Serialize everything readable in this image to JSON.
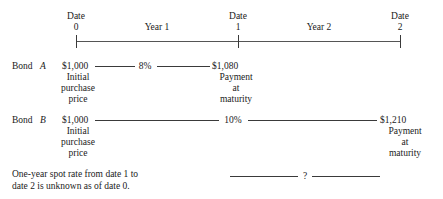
{
  "figure": {
    "type": "timeline-diagram"
  },
  "timeline": {
    "axis": {
      "start_x": 76,
      "end_x": 400,
      "y": 41
    },
    "dates": [
      {
        "label": "Date",
        "value": "0",
        "x": 76
      },
      {
        "label": "Date",
        "value": "1",
        "x": 238
      },
      {
        "label": "Date",
        "value": "2",
        "x": 400
      }
    ],
    "periods": [
      {
        "label": "Year  1",
        "x": 157
      },
      {
        "label": "Year  2",
        "x": 319
      }
    ]
  },
  "bonds": [
    {
      "row_name": "Bond",
      "row_italic": "A",
      "start_amount": "$1,000",
      "start_caption_line1": "Initial",
      "start_caption_line2": "purchase",
      "start_caption_line3": "price",
      "rate": "8%",
      "end_amount": "$1,080",
      "end_caption_line1": "Payment",
      "end_caption_line2": "at",
      "end_caption_line3": "maturity"
    },
    {
      "row_name": "Bond",
      "row_italic": "B",
      "start_amount": "$1,000",
      "start_caption_line1": "Initial",
      "start_caption_line2": "purchase",
      "start_caption_line3": "price",
      "rate": "10%",
      "end_amount": "$1,210",
      "end_caption_line1": "Payment",
      "end_caption_line2": "at",
      "end_caption_line3": "maturity"
    }
  ],
  "note": {
    "line1": "One-year spot rate from date 1 to",
    "line2": "date 2 is unknown as of date 0.",
    "unknown_marker": "?"
  },
  "colors": {
    "ink": "#1a1a1a",
    "rule": "#3a3a3a",
    "background": "#ffffff"
  }
}
